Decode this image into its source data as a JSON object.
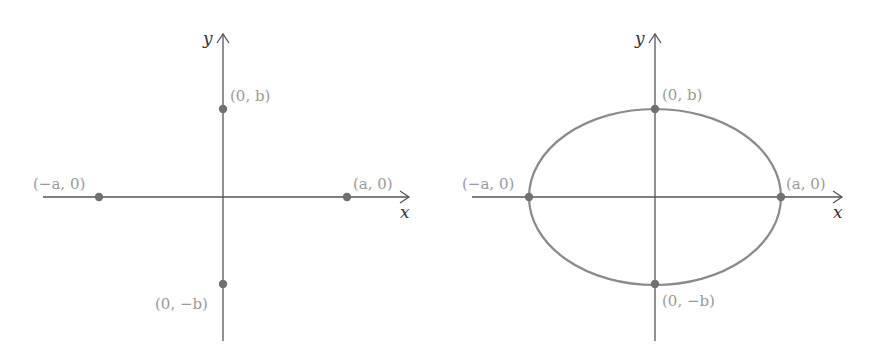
{
  "figures": [
    {
      "id": "left",
      "description": "Coordinate axes with four vertices marked",
      "axes": {
        "x_label": "x",
        "y_label": "y"
      },
      "points": [
        {
          "label": "(0, b)",
          "coords": [
            0,
            "b"
          ]
        },
        {
          "label": "(−a, 0)",
          "coords": [
            "-a",
            0
          ]
        },
        {
          "label": "(a, 0)",
          "coords": [
            "a",
            0
          ]
        },
        {
          "label": "(0, −b)",
          "coords": [
            0,
            "-b"
          ]
        }
      ],
      "curve": null
    },
    {
      "id": "right",
      "description": "Ellipse through the four vertices",
      "axes": {
        "x_label": "x",
        "y_label": "y"
      },
      "points": [
        {
          "label": "(0, b)",
          "coords": [
            0,
            "b"
          ]
        },
        {
          "label": "(−a, 0)",
          "coords": [
            "-a",
            0
          ]
        },
        {
          "label": "(a, 0)",
          "coords": [
            "a",
            0
          ]
        },
        {
          "label": "(0, −b)",
          "coords": [
            0,
            "-b"
          ]
        }
      ],
      "curve": {
        "type": "ellipse",
        "semi_major": "a",
        "semi_minor": "b"
      }
    }
  ],
  "colors": {
    "axis": "#555555",
    "curve": "#8a8a8a",
    "point": "#707070",
    "label": "#9a9a9a"
  }
}
